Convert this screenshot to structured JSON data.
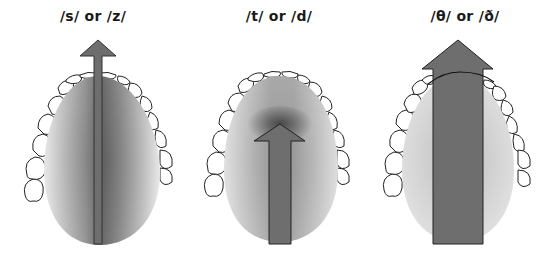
{
  "figure": {
    "panels": [
      {
        "label": "/s/ or /z/",
        "arrow": "narrow central groove, full length",
        "shading": "dark central groove"
      },
      {
        "label": "/t/ or /d/",
        "arrow": "wide arrow stopping mid-tongue",
        "shading": "dark region at alveolar closure"
      },
      {
        "label": "/θ/ or /ð/",
        "arrow": "wide flat arrow extending past teeth",
        "shading": "flat tongue"
      }
    ]
  },
  "colors": {
    "arrow_fill": "#6e6e6e",
    "arrow_stroke": "#222222",
    "tongue_light": "#d8d8d8",
    "tongue_dark": "#4a4a4a",
    "teeth_fill": "#ffffff",
    "teeth_stroke": "#222222",
    "label": "#1a1a1a"
  }
}
